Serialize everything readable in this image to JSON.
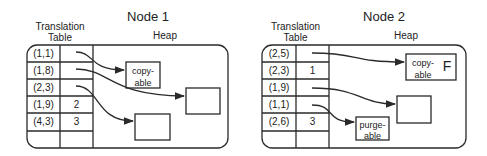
{
  "nodes": [
    {
      "title": "Node 1",
      "table_label": "Translation\nTable",
      "table_label_line1": "Translation",
      "table_label_line2": "Table",
      "heap_label": "Heap",
      "rows": [
        {
          "key": "(1,1)",
          "value": ""
        },
        {
          "key": "(1,8)",
          "value": ""
        },
        {
          "key": "(2,3)",
          "value": ""
        },
        {
          "key": "(1,9)",
          "value": "2"
        },
        {
          "key": "(4,3)",
          "value": "3"
        },
        {
          "key": "",
          "value": ""
        }
      ],
      "heap_objects": [
        {
          "label_line1": "copy-",
          "label_line2": "able",
          "flag": ""
        },
        {
          "label_line1": "",
          "label_line2": "",
          "flag": ""
        },
        {
          "label_line1": "",
          "label_line2": "",
          "flag": ""
        }
      ]
    },
    {
      "title": "Node 2",
      "table_label_line1": "Translation",
      "table_label_line2": "Table",
      "heap_label": "Heap",
      "rows": [
        {
          "key": "(2,5)",
          "value": ""
        },
        {
          "key": "(2,3)",
          "value": "1"
        },
        {
          "key": "(1,9)",
          "value": ""
        },
        {
          "key": "(1,1)",
          "value": ""
        },
        {
          "key": "(2,6)",
          "value": "3"
        },
        {
          "key": "",
          "value": ""
        }
      ],
      "heap_objects": [
        {
          "label_line1": "copy-",
          "label_line2": "able",
          "flag": "F"
        },
        {
          "label_line1": "",
          "label_line2": "",
          "flag": ""
        },
        {
          "label_line1": "purge-",
          "label_line2": "able",
          "flag": ""
        }
      ]
    }
  ],
  "colors": {
    "line": "#2a2a2a",
    "background": "#ffffff"
  }
}
